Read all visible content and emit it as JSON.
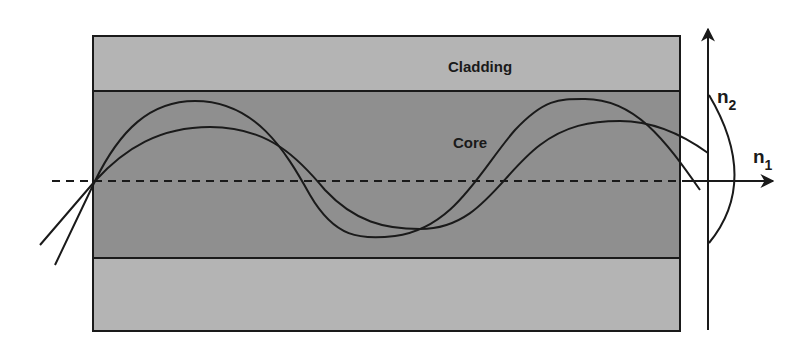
{
  "diagram": {
    "layers": {
      "cladding_label": "Cladding",
      "core_label": "Core"
    },
    "index_profile": {
      "n2_label": "n",
      "n2_subscript": "2",
      "n1_label": "n",
      "n1_subscript": "1"
    },
    "colors": {
      "cladding": "#b4b4b4",
      "core": "#8f8f8f",
      "line": "#1a1a1a",
      "background": "#ffffff"
    }
  }
}
